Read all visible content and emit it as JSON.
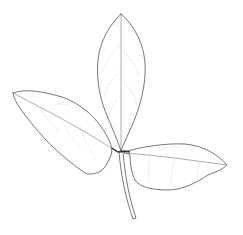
{
  "image": {
    "subject": "trifoliate leaf line drawing",
    "description": "Botanical pencil line drawing of a compound leaf with three leaflets on a single petiole",
    "leaflets": [
      "terminal-leaflet",
      "left-lateral-leaflet",
      "right-lateral-leaflet"
    ],
    "colors": {
      "background": "#ffffff",
      "line": "#555555"
    }
  }
}
